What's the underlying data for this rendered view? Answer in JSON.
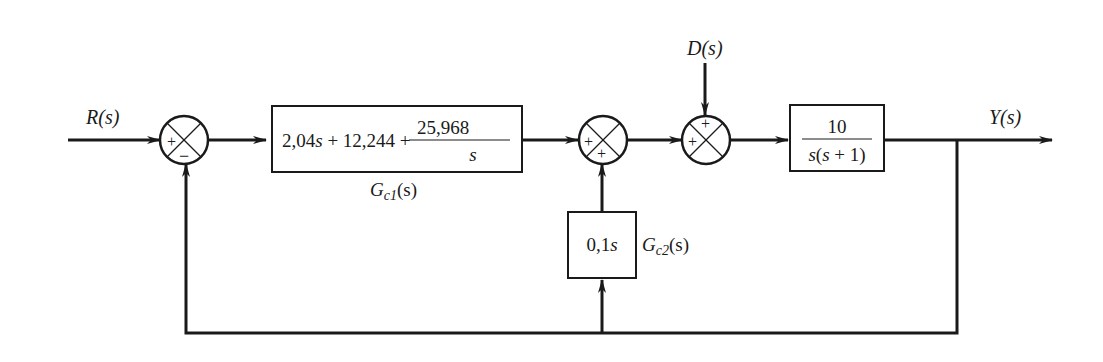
{
  "diagram": {
    "type": "block-diagram",
    "signals": {
      "input": "R(s)",
      "output": "Y(s)",
      "disturbance": "D(s)"
    },
    "summing_junctions": [
      {
        "id": "sum1",
        "signs": {
          "left": "+",
          "bottom": "−"
        }
      },
      {
        "id": "sum2",
        "signs": {
          "left": "+",
          "bottom": "+"
        }
      },
      {
        "id": "sum3",
        "signs": {
          "left": "+",
          "top": "+"
        }
      }
    ],
    "blocks": {
      "gc1": {
        "expr_part1": "2,04",
        "expr_s1": "s",
        "expr_part2": " + 12,244 +",
        "frac_num": "25,968",
        "frac_den": "s",
        "label_G": "G",
        "label_sub": "c1",
        "label_arg": "(s)"
      },
      "plant": {
        "num": "10",
        "den_s": "s",
        "den_rest1": "(",
        "den_s2": "s",
        "den_rest2": " + 1)"
      },
      "gc2": {
        "expr_num": "0,1",
        "expr_s": "s",
        "label_G": "G",
        "label_sub": "c2",
        "label_arg": "(s)"
      }
    }
  }
}
